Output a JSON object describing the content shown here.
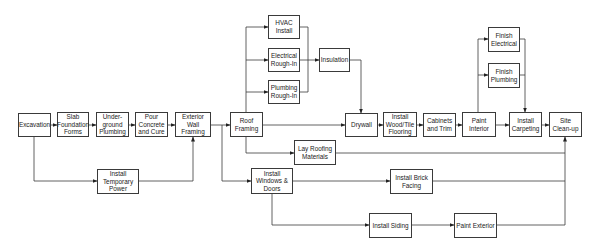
{
  "diagram": {
    "type": "flowchart",
    "title": "",
    "nodes": [
      {
        "id": "excavation",
        "label": "Excavation",
        "x": 18,
        "y": 113,
        "w": 33,
        "h": 24
      },
      {
        "id": "slab",
        "label": "Slab\nFoundation\nForms",
        "x": 57,
        "y": 112,
        "w": 32,
        "h": 25
      },
      {
        "id": "underground",
        "label": "Under-\nground\nPlumbing",
        "x": 96,
        "y": 112,
        "w": 33,
        "h": 25
      },
      {
        "id": "pour",
        "label": "Pour\nConcrete\nand Cure",
        "x": 135,
        "y": 112,
        "w": 33,
        "h": 25
      },
      {
        "id": "exterior_wall",
        "label": "Exterior\nWall\nFraming",
        "x": 175,
        "y": 112,
        "w": 36,
        "h": 25
      },
      {
        "id": "temp_power",
        "label": "Install\nTemporary\nPower",
        "x": 97,
        "y": 169,
        "w": 42,
        "h": 25
      },
      {
        "id": "roof_framing",
        "label": "Roof\nFraming",
        "x": 230,
        "y": 112,
        "w": 33,
        "h": 25
      },
      {
        "id": "hvac",
        "label": "HVAC\nInstall",
        "x": 268,
        "y": 15,
        "w": 32,
        "h": 24
      },
      {
        "id": "electrical",
        "label": "Electrical\nRough-In",
        "x": 268,
        "y": 48,
        "w": 32,
        "h": 24
      },
      {
        "id": "plumbing",
        "label": "Plumbing\nRough-In",
        "x": 268,
        "y": 80,
        "w": 32,
        "h": 24
      },
      {
        "id": "insulation",
        "label": "Insulation",
        "x": 319,
        "y": 48,
        "w": 31,
        "h": 24
      },
      {
        "id": "drywall",
        "label": "Drywall",
        "x": 345,
        "y": 113,
        "w": 33,
        "h": 24
      },
      {
        "id": "wood_tile",
        "label": "Install\nWood/Tile\nFlooring",
        "x": 383,
        "y": 112,
        "w": 34,
        "h": 25
      },
      {
        "id": "cabinets",
        "label": "Cabinets\nand Trim",
        "x": 423,
        "y": 113,
        "w": 33,
        "h": 24
      },
      {
        "id": "paint_interior",
        "label": "Paint\nInterior",
        "x": 462,
        "y": 112,
        "w": 34,
        "h": 25
      },
      {
        "id": "finish_electrical",
        "label": "Finish\nElectrical",
        "x": 488,
        "y": 27,
        "w": 32,
        "h": 25
      },
      {
        "id": "finish_plumbing",
        "label": "Finish\nPlumbing",
        "x": 488,
        "y": 63,
        "w": 32,
        "h": 25
      },
      {
        "id": "carpeting",
        "label": "Install\nCarpeting",
        "x": 509,
        "y": 112,
        "w": 33,
        "h": 25
      },
      {
        "id": "cleanup",
        "label": "Site\nClean-up",
        "x": 549,
        "y": 112,
        "w": 33,
        "h": 25
      },
      {
        "id": "lay_roofing",
        "label": "Lay Roofing\nMaterials",
        "x": 294,
        "y": 140,
        "w": 42,
        "h": 25
      },
      {
        "id": "windows_doors",
        "label": "Install\nWindows &\nDoors",
        "x": 251,
        "y": 168,
        "w": 42,
        "h": 26
      },
      {
        "id": "brick_facing",
        "label": "Install Brick\nFacing",
        "x": 390,
        "y": 169,
        "w": 43,
        "h": 25
      },
      {
        "id": "siding",
        "label": "Install Siding",
        "x": 369,
        "y": 213,
        "w": 43,
        "h": 25
      },
      {
        "id": "paint_exterior",
        "label": "Paint Exterior",
        "x": 454,
        "y": 213,
        "w": 43,
        "h": 25
      }
    ],
    "edges": [
      {
        "from": "excavation",
        "to": "slab"
      },
      {
        "from": "slab",
        "to": "underground"
      },
      {
        "from": "underground",
        "to": "pour"
      },
      {
        "from": "pour",
        "to": "exterior_wall"
      },
      {
        "from": "excavation",
        "to": "temp_power"
      },
      {
        "from": "temp_power",
        "to": "exterior_wall"
      },
      {
        "from": "exterior_wall",
        "to": "roof_framing"
      },
      {
        "from": "exterior_wall",
        "to": "windows_doors"
      },
      {
        "from": "roof_framing",
        "to": "hvac"
      },
      {
        "from": "roof_framing",
        "to": "electrical"
      },
      {
        "from": "roof_framing",
        "to": "plumbing"
      },
      {
        "from": "roof_framing",
        "to": "drywall"
      },
      {
        "from": "roof_framing",
        "to": "lay_roofing"
      },
      {
        "from": "hvac",
        "to": "insulation"
      },
      {
        "from": "electrical",
        "to": "insulation"
      },
      {
        "from": "plumbing",
        "to": "insulation"
      },
      {
        "from": "insulation",
        "to": "drywall"
      },
      {
        "from": "drywall",
        "to": "wood_tile"
      },
      {
        "from": "wood_tile",
        "to": "cabinets"
      },
      {
        "from": "cabinets",
        "to": "paint_interior"
      },
      {
        "from": "paint_interior",
        "to": "finish_electrical"
      },
      {
        "from": "paint_interior",
        "to": "finish_plumbing"
      },
      {
        "from": "paint_interior",
        "to": "carpeting"
      },
      {
        "from": "finish_electrical",
        "to": "carpeting"
      },
      {
        "from": "finish_plumbing",
        "to": "carpeting"
      },
      {
        "from": "carpeting",
        "to": "cleanup"
      },
      {
        "from": "lay_roofing",
        "to": "cleanup"
      },
      {
        "from": "windows_doors",
        "to": "brick_facing"
      },
      {
        "from": "windows_doors",
        "to": "siding"
      },
      {
        "from": "siding",
        "to": "paint_exterior"
      },
      {
        "from": "brick_facing",
        "to": "cleanup"
      },
      {
        "from": "paint_exterior",
        "to": "cleanup"
      }
    ],
    "colors": {
      "line": "#3a3a3a",
      "box_border": "#3a3a3a",
      "background": "#ffffff",
      "text": "#222222"
    }
  }
}
